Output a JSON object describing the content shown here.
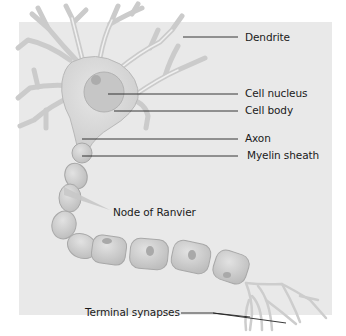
{
  "diagram": {
    "colors": {
      "panel": "#e9e9e9",
      "cell_fill": "#dcdcdc",
      "cell_stroke": "#b4b4b4",
      "nucleus": "#c4c4c4",
      "myelin_fill": "#d2d2d2",
      "leader": "#222222"
    },
    "labels": {
      "dendrite": "Dendrite",
      "cell_nucleus": "Cell nucleus",
      "cell_body": "Cell body",
      "axon": "Axon",
      "myelin_sheath": "Myelin sheath",
      "node_of_ranvier": "Node of Ranvier",
      "terminal_synapses": "Terminal synapses"
    }
  }
}
